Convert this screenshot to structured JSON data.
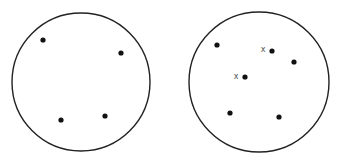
{
  "diagram": {
    "circles": [
      {
        "name": "left-circle",
        "cx": 81,
        "cy": 82,
        "r": 69,
        "dots": [
          [
            43,
            40
          ],
          [
            121,
            53
          ],
          [
            61,
            120
          ],
          [
            105,
            116
          ]
        ],
        "marks": []
      },
      {
        "name": "right-circle",
        "cx": 259,
        "cy": 82,
        "r": 70,
        "dots": [
          [
            217,
            45
          ],
          [
            272,
            51
          ],
          [
            294,
            62
          ],
          [
            245,
            77
          ],
          [
            230,
            113
          ],
          [
            279,
            117
          ]
        ],
        "marks": [
          {
            "label": "x",
            "x": 263,
            "y": 52
          },
          {
            "label": "x",
            "x": 236,
            "y": 79
          }
        ]
      }
    ],
    "stroke_color": "#222222",
    "dot_color": "#111111",
    "mark_color": "#555555"
  }
}
